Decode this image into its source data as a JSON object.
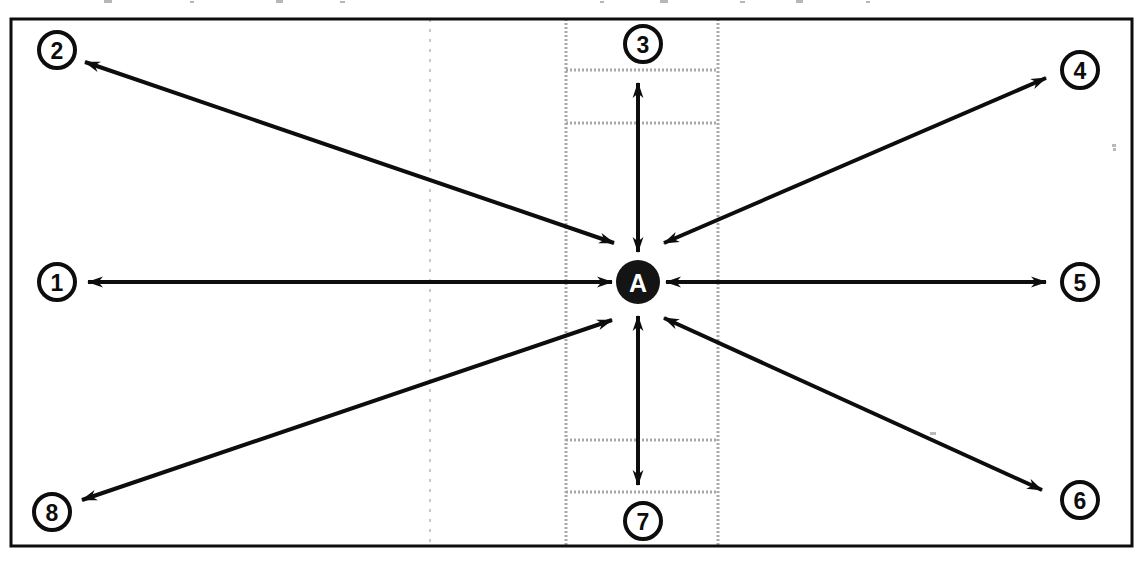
{
  "figure": {
    "background_color": "#ffffff",
    "ink_color": "#0d0d0d",
    "dotted_color": "#9a9a9a",
    "faint_color": "#c8c8c8"
  },
  "frame": {
    "name": "outer-border-rectangle",
    "x": 11,
    "y": 19,
    "width": 1121,
    "height": 527,
    "stroke_width": 3,
    "color": "#0d0d0d"
  },
  "center_node": {
    "label": "A",
    "cx": 638,
    "cy": 282,
    "r": 22,
    "fill": "#141414",
    "text_color": "#ffffff"
  },
  "ports": [
    {
      "label": "1",
      "cx": 57,
      "cy": 282,
      "r": 18,
      "direction": "west"
    },
    {
      "label": "2",
      "cx": 57,
      "cy": 50,
      "r": 18,
      "direction": "northwest"
    },
    {
      "label": "3",
      "cx": 643,
      "cy": 44,
      "r": 18,
      "direction": "north"
    },
    {
      "label": "4",
      "cx": 1080,
      "cy": 70,
      "r": 18,
      "direction": "northeast"
    },
    {
      "label": "5",
      "cx": 1080,
      "cy": 282,
      "r": 18,
      "direction": "east"
    },
    {
      "label": "6",
      "cx": 1080,
      "cy": 500,
      "r": 18,
      "direction": "southeast"
    },
    {
      "label": "7",
      "cx": 643,
      "cy": 521,
      "r": 18,
      "direction": "south"
    },
    {
      "label": "8",
      "cx": 52,
      "cy": 512,
      "r": 18,
      "direction": "southwest"
    }
  ],
  "arrows": [
    {
      "name": "arrow-1",
      "port": "1",
      "x1": 88,
      "y1": 282,
      "x2": 612,
      "y2": 282,
      "double_headed": true
    },
    {
      "name": "arrow-2",
      "port": "2",
      "x1": 85,
      "y1": 62,
      "x2": 614,
      "y2": 243,
      "double_headed": true
    },
    {
      "name": "arrow-3",
      "port": "3",
      "x1": 638,
      "y1": 83,
      "x2": 638,
      "y2": 252,
      "double_headed": true
    },
    {
      "name": "arrow-4",
      "port": "4",
      "x1": 1046,
      "y1": 78,
      "x2": 664,
      "y2": 243,
      "double_headed": true
    },
    {
      "name": "arrow-5",
      "port": "5",
      "x1": 1046,
      "y1": 282,
      "x2": 666,
      "y2": 282,
      "double_headed": true
    },
    {
      "name": "arrow-6",
      "port": "6",
      "x1": 1042,
      "y1": 490,
      "x2": 664,
      "y2": 318,
      "double_headed": true
    },
    {
      "name": "arrow-7",
      "port": "7",
      "x1": 638,
      "y1": 485,
      "x2": 638,
      "y2": 316,
      "double_headed": true
    },
    {
      "name": "arrow-8",
      "port": "8",
      "x1": 82,
      "y1": 500,
      "x2": 612,
      "y2": 320,
      "double_headed": true
    }
  ],
  "dotted_band": {
    "name": "vertical-dotted-band",
    "left_x": 566,
    "right_x": 718,
    "top_y": 19,
    "bottom_y": 546,
    "horizontal_rules_y": [
      70,
      123,
      440,
      492
    ]
  },
  "faint_guide": {
    "name": "faint-dashed-vertical-guide",
    "x": 430,
    "top_y": 19,
    "bottom_y": 546
  },
  "scan_specks": [
    {
      "x": 1112,
      "y": 144,
      "w": 4,
      "h": 3
    },
    {
      "x": 1113,
      "y": 148,
      "w": 3,
      "h": 3
    },
    {
      "x": 930,
      "y": 432,
      "w": 6,
      "h": 3
    }
  ]
}
